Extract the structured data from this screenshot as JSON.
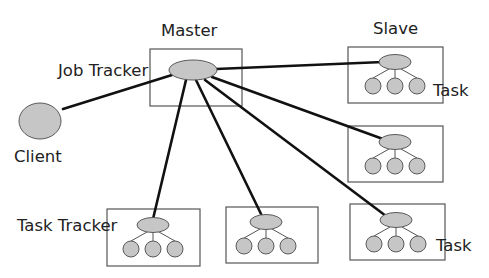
{
  "diagram": {
    "labels": {
      "master": "Master",
      "slave": "Slave",
      "job_tracker": "Job Tracker",
      "client": "Client",
      "task_tracker": "Task Tracker",
      "task_top": "Task",
      "task_bottom": "Task"
    },
    "nodes": {
      "client": {
        "name": "Client",
        "shape": "ellipse"
      },
      "job_tracker": {
        "name": "Job Tracker",
        "group": "Master"
      },
      "task_trackers": [
        {
          "id": "slave-1",
          "tasks": 3
        },
        {
          "id": "slave-2",
          "tasks": 3
        },
        {
          "id": "slave-3",
          "tasks": 3
        },
        {
          "id": "slave-4",
          "tasks": 3
        },
        {
          "id": "slave-5",
          "tasks": 3
        }
      ]
    },
    "edges": [
      {
        "from": "client",
        "to": "job_tracker"
      },
      {
        "from": "job_tracker",
        "to": "slave-1"
      },
      {
        "from": "job_tracker",
        "to": "slave-2"
      },
      {
        "from": "job_tracker",
        "to": "slave-3"
      },
      {
        "from": "job_tracker",
        "to": "slave-4"
      },
      {
        "from": "job_tracker",
        "to": "slave-5"
      }
    ],
    "colors": {
      "node_fill": "#c6c6c6",
      "node_stroke": "#5a5a5a",
      "edge": "#111111",
      "box": "#555555"
    }
  }
}
